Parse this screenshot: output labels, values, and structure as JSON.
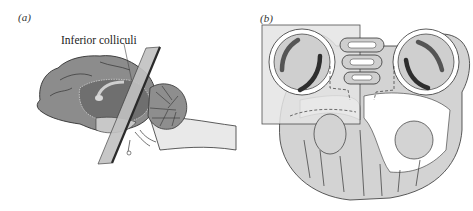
{
  "figure": {
    "panel_a": {
      "label": "(a)",
      "annotation": "Inferior colliculi",
      "description": "Sagittal view of brain with a slicing plane through the inferior colliculi"
    },
    "panel_b": {
      "label": "(b)",
      "description": "Coronal section showing two eyes, nasal structure and a highlighted boxed region"
    }
  },
  "colors": {
    "brain_gray": "#8a8a8a",
    "midbrain_dark": "#6e6e6e",
    "light_fill": "#d4d4d4",
    "highlight_box": "#e6e6e6",
    "outline": "#2a2a2a",
    "dark_band": "#3a3a3a"
  }
}
